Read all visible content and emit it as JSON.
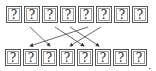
{
  "top_row": [
    "?",
    "?",
    "?",
    "?",
    "?",
    "?",
    "?",
    "?"
  ],
  "bottom_row": [
    "?",
    "?",
    "?",
    "?",
    "?",
    "?",
    "?",
    "?"
  ],
  "trailing": ".",
  "arrows": [
    {
      "from": [
        30,
        27
      ],
      "to": [
        50,
        46
      ]
    },
    {
      "from": [
        55,
        27
      ],
      "to": [
        84,
        46
      ]
    },
    {
      "from": [
        70,
        27
      ],
      "to": [
        99,
        46
      ]
    },
    {
      "from": [
        88,
        27
      ],
      "to": [
        30,
        46
      ]
    },
    {
      "from": [
        101,
        27
      ],
      "to": [
        70,
        46
      ]
    }
  ]
}
